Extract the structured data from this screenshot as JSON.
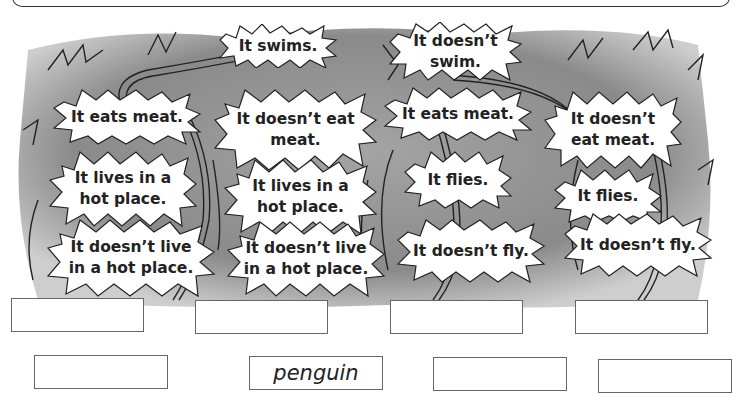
{
  "worksheet": {
    "colors": {
      "wash": "#8a8a8a",
      "bubble": "#ffffff",
      "ink": "#222222",
      "box_border": "#666666"
    },
    "bubbles": [
      {
        "id": "swims",
        "text": "It swims."
      },
      {
        "id": "doesnt-swim",
        "text": "It doesn’t\nswim."
      },
      {
        "id": "eats-meat-1",
        "text": "It eats meat."
      },
      {
        "id": "doesnt-eat-meat-1",
        "text": "It doesn’t eat\nmeat."
      },
      {
        "id": "eats-meat-2",
        "text": "It eats meat."
      },
      {
        "id": "doesnt-eat-meat-2",
        "text": "It doesn’t\neat meat."
      },
      {
        "id": "lives-hot-1",
        "text": "It lives in a\nhot place."
      },
      {
        "id": "lives-hot-2",
        "text": "It lives in a\nhot place."
      },
      {
        "id": "flies-1",
        "text": "It flies."
      },
      {
        "id": "flies-2",
        "text": "It flies."
      },
      {
        "id": "not-hot-1",
        "text": "It doesn’t live\nin a hot place."
      },
      {
        "id": "not-hot-2",
        "text": "It doesn’t live\nin a hot place."
      },
      {
        "id": "doesnt-fly-1",
        "text": "It doesn’t fly."
      },
      {
        "id": "doesnt-fly-2",
        "text": "It doesn’t fly."
      }
    ],
    "answer_boxes": [
      {
        "value": ""
      },
      {
        "value": ""
      },
      {
        "value": ""
      },
      {
        "value": ""
      },
      {
        "value": ""
      },
      {
        "value": "penguin"
      },
      {
        "value": ""
      },
      {
        "value": ""
      }
    ]
  }
}
